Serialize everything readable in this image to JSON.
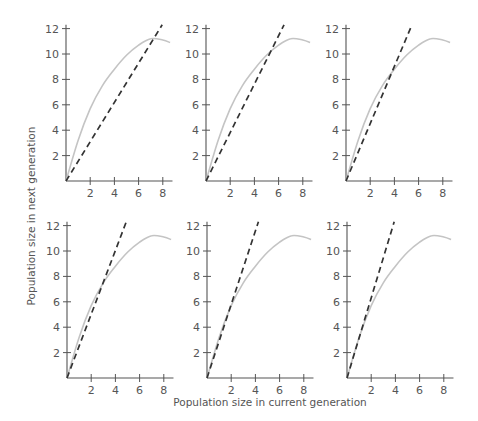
{
  "figure": {
    "xlabel": "Population size in current generation",
    "ylabel": "Population size in next generation",
    "colors": {
      "curve": "#c4c4c4",
      "line": "#333333",
      "axis": "#555555"
    }
  },
  "chart_data": [
    {
      "type": "line",
      "panel": 1,
      "title": "",
      "xlabel": "Population size in current generation",
      "ylabel": "Population size in next generation",
      "xticks": [
        2,
        4,
        6,
        8
      ],
      "yticks": [
        2,
        4,
        6,
        8,
        10,
        12
      ],
      "xlim": [
        0,
        8.8
      ],
      "ylim": [
        0,
        12.3
      ],
      "grid": false,
      "series": [
        {
          "name": "recruitment curve",
          "style": "solid-gray",
          "x": [
            0,
            1,
            2,
            3,
            4,
            5,
            6,
            7,
            8,
            8.6
          ],
          "y": [
            0,
            3.2,
            5.7,
            7.5,
            8.8,
            9.9,
            10.7,
            11.2,
            11.1,
            10.9
          ]
        },
        {
          "name": "replacement line",
          "style": "dashed-black",
          "slope": 1.55,
          "x": [
            0,
            7.95
          ],
          "y": [
            0,
            12.3
          ]
        }
      ]
    },
    {
      "type": "line",
      "panel": 2,
      "xticks": [
        2,
        4,
        6,
        8
      ],
      "yticks": [
        2,
        4,
        6,
        8,
        10,
        12
      ],
      "xlim": [
        0,
        8.8
      ],
      "ylim": [
        0,
        12.3
      ],
      "grid": false,
      "series": [
        {
          "name": "recruitment curve",
          "style": "solid-gray",
          "x": [
            0,
            1,
            2,
            3,
            4,
            5,
            6,
            7,
            8,
            8.6
          ],
          "y": [
            0,
            3.2,
            5.7,
            7.5,
            8.8,
            9.9,
            10.7,
            11.2,
            11.1,
            10.9
          ]
        },
        {
          "name": "replacement line",
          "style": "dashed-black",
          "slope": 1.9,
          "x": [
            0,
            6.45
          ],
          "y": [
            0,
            12.3
          ]
        }
      ]
    },
    {
      "type": "line",
      "panel": 3,
      "xticks": [
        2,
        4,
        6,
        8
      ],
      "yticks": [
        2,
        4,
        6,
        8,
        10,
        12
      ],
      "xlim": [
        0,
        8.8
      ],
      "ylim": [
        0,
        12.3
      ],
      "grid": false,
      "series": [
        {
          "name": "recruitment curve",
          "style": "solid-gray",
          "x": [
            0,
            1,
            2,
            3,
            4,
            5,
            6,
            7,
            8,
            8.6
          ],
          "y": [
            0,
            3.2,
            5.7,
            7.5,
            8.8,
            9.9,
            10.7,
            11.2,
            11.1,
            10.9
          ]
        },
        {
          "name": "replacement line",
          "style": "dashed-black",
          "slope": 2.25,
          "x": [
            0,
            5.45
          ],
          "y": [
            0,
            12.3
          ]
        }
      ]
    },
    {
      "type": "line",
      "panel": 4,
      "xticks": [
        2,
        4,
        6,
        8
      ],
      "yticks": [
        2,
        4,
        6,
        8,
        10,
        12
      ],
      "xlim": [
        0,
        8.8
      ],
      "ylim": [
        0,
        12.3
      ],
      "grid": false,
      "series": [
        {
          "name": "recruitment curve",
          "style": "solid-gray",
          "x": [
            0,
            1,
            2,
            3,
            4,
            5,
            6,
            7,
            8,
            8.6
          ],
          "y": [
            0,
            3.2,
            5.7,
            7.5,
            8.8,
            9.9,
            10.7,
            11.2,
            11.1,
            10.9
          ]
        },
        {
          "name": "replacement line",
          "style": "dashed-black",
          "slope": 2.5,
          "x": [
            0,
            4.9
          ],
          "y": [
            0,
            12.3
          ]
        }
      ]
    },
    {
      "type": "line",
      "panel": 5,
      "xticks": [
        2,
        4,
        6,
        8
      ],
      "yticks": [
        2,
        4,
        6,
        8,
        10,
        12
      ],
      "xlim": [
        0,
        8.8
      ],
      "ylim": [
        0,
        12.3
      ],
      "grid": false,
      "series": [
        {
          "name": "recruitment curve",
          "style": "solid-gray",
          "x": [
            0,
            1,
            2,
            3,
            4,
            5,
            6,
            7,
            8,
            8.6
          ],
          "y": [
            0,
            3.2,
            5.7,
            7.5,
            8.8,
            9.9,
            10.7,
            11.2,
            11.1,
            10.9
          ]
        },
        {
          "name": "replacement line",
          "style": "dashed-black",
          "slope": 2.9,
          "x": [
            0,
            4.25
          ],
          "y": [
            0,
            12.3
          ]
        }
      ]
    },
    {
      "type": "line",
      "panel": 6,
      "xticks": [
        2,
        4,
        6,
        8
      ],
      "yticks": [
        2,
        4,
        6,
        8,
        10,
        12
      ],
      "xlim": [
        0,
        8.8
      ],
      "ylim": [
        0,
        12.3
      ],
      "grid": false,
      "series": [
        {
          "name": "recruitment curve",
          "style": "solid-gray",
          "x": [
            0,
            1,
            2,
            3,
            4,
            5,
            6,
            7,
            8,
            8.6
          ],
          "y": [
            0,
            3.2,
            5.7,
            7.5,
            8.8,
            9.9,
            10.7,
            11.2,
            11.1,
            10.9
          ]
        },
        {
          "name": "replacement line",
          "style": "dashed-black",
          "slope": 3.15,
          "x": [
            0,
            3.9
          ],
          "y": [
            0,
            12.3
          ]
        }
      ]
    }
  ],
  "layout": {
    "panels": [
      {
        "ox": 66,
        "oy": 181
      },
      {
        "ox": 206,
        "oy": 181
      },
      {
        "ox": 346,
        "oy": 181
      },
      {
        "ox": 67,
        "oy": 378
      },
      {
        "ox": 207,
        "oy": 378
      },
      {
        "ox": 347,
        "oy": 378
      }
    ],
    "px_per_x": 12.1,
    "px_per_y": 12.7
  }
}
